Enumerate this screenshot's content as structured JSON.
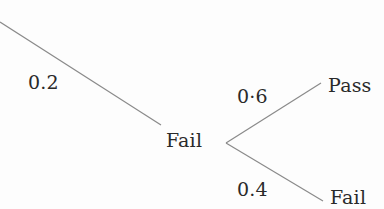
{
  "diagram": {
    "type": "probability-tree",
    "edge_color": "#8a8a8a",
    "text_color": "#2a2a2a",
    "nodes": {
      "fail_mid": "Fail",
      "pass_end": "Pass",
      "fail_end": "Fail"
    },
    "edges": {
      "to_fail_mid": "0.2",
      "to_pass": "0·6",
      "to_fail_end": "0.4"
    }
  }
}
